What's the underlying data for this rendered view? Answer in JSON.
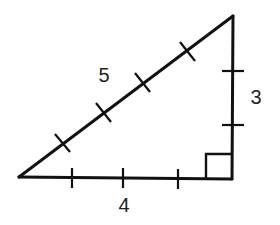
{
  "diagram": {
    "type": "right-triangle",
    "stroke_color": "#111111",
    "vertices": {
      "left": [
        19,
        177
      ],
      "right_angle": [
        232,
        179
      ],
      "top": [
        233,
        16
      ]
    },
    "sides": [
      {
        "name": "base",
        "label": "4",
        "ticks": 3,
        "label_pos": [
          124,
          205
        ]
      },
      {
        "name": "height",
        "label": "3",
        "ticks": 2,
        "label_pos": [
          256,
          97
        ]
      },
      {
        "name": "hypotenuse",
        "label": "5",
        "ticks": 4,
        "label_pos": [
          104,
          74
        ]
      }
    ],
    "right_angle_marker": true
  }
}
